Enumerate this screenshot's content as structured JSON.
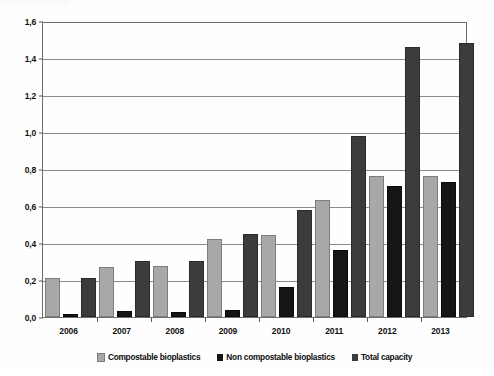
{
  "chart_data": {
    "type": "bar",
    "title": "",
    "subtitle": "",
    "xlabel": "",
    "ylabel": "",
    "categories": [
      "2006",
      "2007",
      "2008",
      "2009",
      "2010",
      "2011",
      "2012",
      "2013"
    ],
    "series": [
      {
        "name": "Compostable bioplastics",
        "color": "#a8a8a8",
        "values": [
          0.2,
          0.26,
          0.265,
          0.41,
          0.43,
          0.62,
          0.75,
          0.75
        ]
      },
      {
        "name": "Non compostable bioplastics",
        "color": "#151515",
        "values": [
          0.005,
          0.02,
          0.015,
          0.025,
          0.15,
          0.35,
          0.7,
          0.72
        ]
      },
      {
        "name": "Total capacity",
        "color": "#3c3c3c",
        "values": [
          0.2,
          0.29,
          0.29,
          0.44,
          0.57,
          0.97,
          1.45,
          1.47
        ]
      }
    ],
    "ylim": [
      0.0,
      1.6
    ],
    "ytick_values": [
      0.0,
      0.2,
      0.4,
      0.6,
      0.8,
      1.0,
      1.2,
      1.4,
      1.6
    ],
    "ytick_labels": [
      "0,0",
      "0,2",
      "0,4",
      "0,6",
      "0,8",
      "1,0",
      "1,2",
      "1,4",
      "1,6"
    ],
    "grid": true,
    "legend_position": "bottom",
    "decimal_separator": ","
  },
  "legend": {
    "items": [
      {
        "label": "Compostable bioplastics"
      },
      {
        "label": "Non compostable bioplastics"
      },
      {
        "label": "Total capacity"
      }
    ]
  }
}
